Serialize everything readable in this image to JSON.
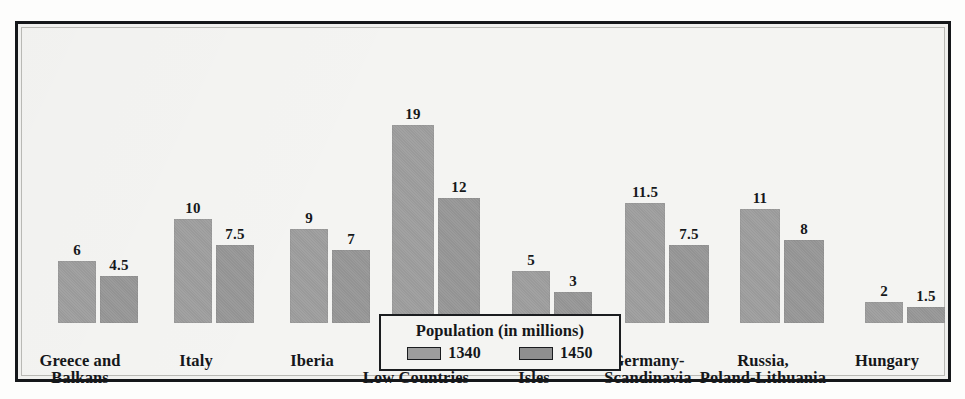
{
  "chart_data": {
    "type": "bar",
    "title": "Population (in millions)",
    "xlabel": "",
    "ylabel": "Population (in millions)",
    "ylim": [
      0,
      19
    ],
    "grid": false,
    "legend_position": "bottom-center",
    "categories": [
      "Greece and Balkans",
      "Italy",
      "Iberia",
      "France-Low Countries",
      "British Isles",
      "Germany-Scandinavia",
      "Russia, Poland-Lithuania",
      "Hungary"
    ],
    "category_lines": [
      [
        "Greece and",
        "Balkans"
      ],
      [
        "Italy",
        ""
      ],
      [
        "Iberia",
        ""
      ],
      [
        "France-",
        "Low Countries"
      ],
      [
        "British",
        "Isles"
      ],
      [
        "Germany-",
        "Scandinavia"
      ],
      [
        "Russia,",
        "Poland-Lithuania"
      ],
      [
        "Hungary",
        ""
      ]
    ],
    "series": [
      {
        "name": "1340",
        "color": "#9d9d9d",
        "values": [
          6,
          10,
          9,
          19,
          5,
          11.5,
          11,
          2
        ],
        "labels": [
          "6",
          "10",
          "9",
          "19",
          "5",
          "11.5",
          "11",
          "2"
        ]
      },
      {
        "name": "1450",
        "color": "#8f8f8f",
        "values": [
          4.5,
          7.5,
          7,
          12,
          3,
          7.5,
          8,
          1.5
        ],
        "labels": [
          "4.5",
          "7.5",
          "7",
          "12",
          "3",
          "7.5",
          "8",
          "1.5"
        ]
      }
    ]
  },
  "legend": {
    "title": "Population (in millions)",
    "items": [
      {
        "label": "1340",
        "color": "#9d9d9d"
      },
      {
        "label": "1450",
        "color": "#8f8f8f"
      }
    ]
  },
  "layout": {
    "groups": [
      {
        "left": 36,
        "bar_width": 38,
        "gap": 4,
        "label_left": 58
      },
      {
        "left": 152,
        "bar_width": 38,
        "gap": 4,
        "label_left": 174
      },
      {
        "left": 268,
        "bar_width": 38,
        "gap": 4,
        "label_left": 290
      },
      {
        "left": 370,
        "bar_width": 42,
        "gap": 4,
        "label_left": 394
      },
      {
        "left": 490,
        "bar_width": 38,
        "gap": 4,
        "label_left": 512
      },
      {
        "left": 603,
        "bar_width": 40,
        "gap": 4,
        "label_left": 626
      },
      {
        "left": 718,
        "bar_width": 40,
        "gap": 4,
        "label_left": 741
      },
      {
        "left": 843,
        "bar_width": 38,
        "gap": 4,
        "label_left": 865
      }
    ],
    "baseline_y": 232,
    "px_per_unit": 10.4
  },
  "colors": {
    "frame": "#15171a",
    "background": "#f4f4f2",
    "bar_1340": "#9d9d9d",
    "bar_1450": "#8f8f8f",
    "text": "#15171a"
  }
}
